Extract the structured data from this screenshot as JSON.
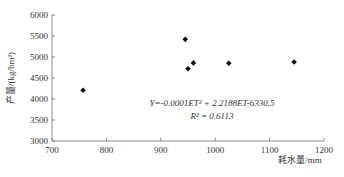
{
  "chart_data": {
    "type": "scatter",
    "title": "",
    "xlabel": "耗水量/mm",
    "ylabel": "产量/(kg/hm²)",
    "xlim": [
      700,
      1200
    ],
    "ylim": [
      3000,
      6000
    ],
    "xticks": [
      700,
      800,
      900,
      1000,
      1100,
      1200
    ],
    "yticks": [
      3000,
      3500,
      4000,
      4500,
      5000,
      5500,
      6000
    ],
    "grid": false,
    "legend": null,
    "series": [
      {
        "name": "observed",
        "marker": "diamond",
        "points": [
          {
            "x": 757,
            "y": 4210
          },
          {
            "x": 945,
            "y": 5420
          },
          {
            "x": 950,
            "y": 4720
          },
          {
            "x": 960,
            "y": 4860
          },
          {
            "x": 1025,
            "y": 4850
          },
          {
            "x": 1145,
            "y": 4880
          }
        ]
      },
      {
        "name": "fit",
        "type": "line",
        "equation": {
          "a": -0.0001,
          "b": 2.2188,
          "c": -6330.5
        },
        "x_range": [
          757,
          1200
        ]
      }
    ],
    "annotations": {
      "equation": "Y=-0.0001ET² + 2.2188ET-6330.5",
      "r_squared": "R² = 0.6113"
    }
  }
}
